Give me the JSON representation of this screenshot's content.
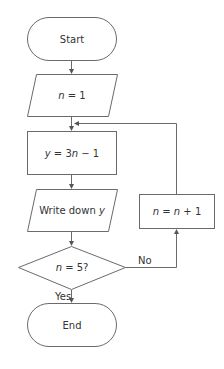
{
  "flowchart": {
    "nodes": [
      {
        "id": "start",
        "type": "terminal",
        "label": "Start"
      },
      {
        "id": "init",
        "type": "input-output",
        "label_var": "n",
        "label_rest": " = 1"
      },
      {
        "id": "compute",
        "type": "process",
        "label_y": "y",
        "label_mid": " = 3",
        "label_n": "n",
        "label_end": " − 1"
      },
      {
        "id": "output",
        "type": "input-output",
        "label_text": "Write down ",
        "label_var": "y"
      },
      {
        "id": "decision",
        "type": "decision",
        "label_var": "n",
        "label_rest": " = 5?"
      },
      {
        "id": "increment",
        "type": "process",
        "label_n1": "n",
        "label_eq": " = ",
        "label_n2": "n",
        "label_rest": " + 1"
      },
      {
        "id": "end",
        "type": "terminal",
        "label": "End"
      }
    ],
    "edges": [
      {
        "from": "start",
        "to": "init"
      },
      {
        "from": "init",
        "to": "compute"
      },
      {
        "from": "compute",
        "to": "output"
      },
      {
        "from": "output",
        "to": "decision"
      },
      {
        "from": "decision",
        "to": "end",
        "label": "Yes"
      },
      {
        "from": "decision",
        "to": "increment",
        "label": "No"
      },
      {
        "from": "increment",
        "to": "compute"
      }
    ]
  },
  "colors": {
    "stroke": "#6a6a6a",
    "text": "#333333",
    "background": "#ffffff"
  }
}
